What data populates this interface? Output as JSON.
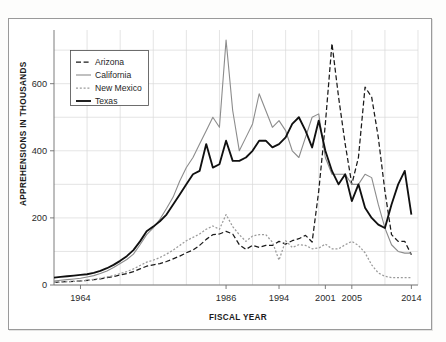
{
  "chart_data": {
    "type": "line",
    "title": "",
    "xlabel": "FISCAL YEAR",
    "ylabel": "APPREHENSIONS IN THOUSANDS",
    "xlim": [
      1960,
      2015
    ],
    "ylim": [
      0,
      760
    ],
    "yticks": [
      0,
      200,
      400,
      600
    ],
    "ytick_labels": [
      "0",
      "200",
      "400",
      "600"
    ],
    "xticks": [
      1964,
      1986,
      1994,
      2001,
      2005,
      2014
    ],
    "xtick_labels": [
      "1964",
      "1986",
      "1994",
      "2001",
      "2005",
      "2014"
    ],
    "grid": true,
    "legend_position": "upper-left",
    "x": [
      1960,
      1961,
      1962,
      1963,
      1964,
      1965,
      1966,
      1967,
      1968,
      1969,
      1970,
      1971,
      1972,
      1973,
      1974,
      1975,
      1976,
      1977,
      1978,
      1979,
      1980,
      1981,
      1982,
      1983,
      1984,
      1985,
      1986,
      1987,
      1988,
      1989,
      1990,
      1991,
      1992,
      1993,
      1994,
      1995,
      1996,
      1997,
      1998,
      1999,
      2000,
      2001,
      2002,
      2003,
      2004,
      2005,
      2006,
      2007,
      2008,
      2009,
      2010,
      2011,
      2012,
      2013,
      2014
    ],
    "series": [
      {
        "name": "Arizona",
        "color": "#1a1a1a",
        "style": "dashed",
        "values": [
          8,
          9,
          10,
          11,
          12,
          14,
          16,
          18,
          22,
          25,
          30,
          34,
          40,
          48,
          56,
          60,
          64,
          70,
          78,
          86,
          96,
          104,
          118,
          136,
          150,
          152,
          160,
          152,
          120,
          106,
          118,
          112,
          118,
          118,
          130,
          122,
          132,
          138,
          148,
          128,
          280,
          480,
          720,
          560,
          420,
          300,
          380,
          590,
          560,
          440,
          280,
          150,
          130,
          130,
          90
        ]
      },
      {
        "name": "California",
        "color": "#8c8c8c",
        "style": "solid",
        "values": [
          12,
          14,
          16,
          18,
          20,
          24,
          28,
          34,
          42,
          52,
          64,
          76,
          92,
          120,
          150,
          170,
          196,
          228,
          262,
          310,
          350,
          380,
          420,
          460,
          500,
          470,
          730,
          520,
          400,
          440,
          480,
          570,
          520,
          470,
          490,
          460,
          400,
          380,
          440,
          500,
          510,
          380,
          330,
          330,
          330,
          300,
          300,
          330,
          320,
          240,
          170,
          120,
          100,
          95,
          95
        ]
      },
      {
        "name": "New Mexico",
        "color": "#9b9b9b",
        "style": "dotted",
        "values": [
          8,
          9,
          10,
          11,
          12,
          14,
          17,
          20,
          24,
          28,
          34,
          40,
          48,
          58,
          68,
          74,
          82,
          92,
          104,
          118,
          132,
          142,
          152,
          166,
          176,
          166,
          210,
          174,
          150,
          130,
          146,
          150,
          150,
          128,
          74,
          132,
          112,
          120,
          118,
          108,
          110,
          122,
          108,
          108,
          120,
          130,
          118,
          96,
          60,
          36,
          26,
          22,
          22,
          22,
          22
        ]
      },
      {
        "name": "Texas",
        "color": "#101010",
        "style": "solid-bold",
        "values": [
          22,
          24,
          26,
          28,
          30,
          32,
          36,
          42,
          50,
          60,
          72,
          86,
          104,
          130,
          160,
          174,
          190,
          210,
          240,
          270,
          300,
          330,
          340,
          420,
          350,
          360,
          430,
          370,
          370,
          380,
          400,
          430,
          430,
          410,
          420,
          440,
          480,
          500,
          460,
          410,
          490,
          400,
          340,
          300,
          330,
          250,
          300,
          230,
          200,
          180,
          170,
          240,
          300,
          340,
          210
        ]
      }
    ]
  },
  "legend": {
    "entries": [
      {
        "label": "Arizona"
      },
      {
        "label": "California"
      },
      {
        "label": "New Mexico"
      },
      {
        "label": "Texas"
      }
    ]
  }
}
